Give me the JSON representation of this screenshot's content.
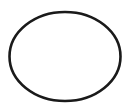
{
  "canvas": {
    "width": 130,
    "height": 107,
    "background": "#ffffff"
  },
  "shape": {
    "type": "ellipse",
    "cx": 65,
    "cy": 56.5,
    "rx": 55.5,
    "ry": 44.5,
    "stroke": "#1a1a1a",
    "stroke_width": 2.6,
    "fill": "none"
  }
}
